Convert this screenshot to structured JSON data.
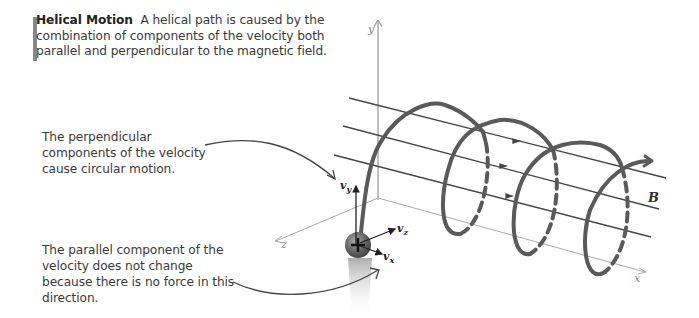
{
  "caption": {
    "title": "Helical Motion",
    "text": "A helical path is caused by the combination of components of the velocity both parallel and perpendicular to the magnetic field."
  },
  "notes": {
    "perpendicular": "The perpendicular components of the velocity cause circular motion.",
    "parallel": "The parallel component of the velocity does not change because there is no force in this direction."
  },
  "axes": {
    "x": "x",
    "y": "y",
    "z": "z"
  },
  "vectors": {
    "vy": {
      "main": "v",
      "sub": "y"
    },
    "vz": {
      "main": "v",
      "sub": "z"
    },
    "vx": {
      "main": "v",
      "sub": "x"
    }
  },
  "field_label": "B",
  "colors": {
    "helix": "#5a5a5a",
    "field_lines": "#444444",
    "axes": "#aaaaaa",
    "text": "#3a3a3a",
    "caption_bar": "#888888"
  }
}
